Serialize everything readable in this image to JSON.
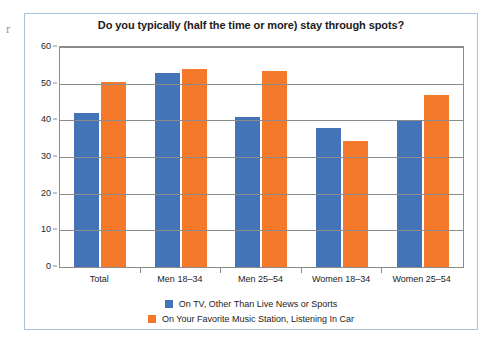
{
  "artifact": {
    "glyph": "r"
  },
  "chart_data": {
    "type": "bar",
    "title": "Do you typically (half the time or more) stay through spots?",
    "xlabel": "",
    "ylabel": "",
    "ylim": [
      0,
      60
    ],
    "yticks": [
      0,
      10,
      20,
      30,
      40,
      50,
      60
    ],
    "grid": true,
    "legend_position": "bottom",
    "categories": [
      "Total",
      "Men 18–34",
      "Men 25–54",
      "Women 18–34",
      "Women 25–54"
    ],
    "series": [
      {
        "name": "On TV, Other Than Live News or Sports",
        "color": "#4573b8",
        "values": [
          42,
          53,
          41,
          38,
          40
        ]
      },
      {
        "name": "On Your Favorite Music Station, Listening In Car",
        "color": "#f4792a",
        "values": [
          50.5,
          54,
          53.5,
          34.5,
          47
        ]
      }
    ]
  }
}
